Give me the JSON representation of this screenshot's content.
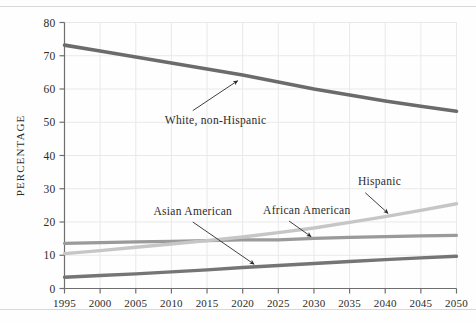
{
  "figure": {
    "background_color": "#fefefe",
    "axis_color": "#6e6e6e",
    "grid_color": "#e9e9ea",
    "text_color": "#2b2b2b"
  },
  "chart_data": {
    "type": "line",
    "title": "",
    "subtitle": "",
    "xlabel": "",
    "ylabel": "PERCENTAGE",
    "x": [
      1995,
      2000,
      2005,
      2010,
      2015,
      2020,
      2025,
      2030,
      2035,
      2040,
      2045,
      2050
    ],
    "xlim": [
      1995,
      2050
    ],
    "ylim": [
      0,
      80
    ],
    "xticks": [
      "1995",
      "2000",
      "2005",
      "2010",
      "2015",
      "2020",
      "2025",
      "2030",
      "2035",
      "2040",
      "2045",
      "2050"
    ],
    "yticks": [
      "0",
      "10",
      "20",
      "30",
      "40",
      "50",
      "60",
      "70",
      "80"
    ],
    "grid": true,
    "legend_position": "inline-annotations",
    "series": [
      {
        "name": "White, non-Hispanic",
        "color": "#6b6b6b",
        "width": 3.6,
        "values": [
          73.2,
          71.4,
          69.6,
          67.8,
          66.0,
          64.2,
          62.1,
          60.0,
          58.2,
          56.4,
          54.8,
          53.3
        ]
      },
      {
        "name": "African American",
        "color": "#9a9a9a",
        "width": 3.2,
        "values": [
          13.6,
          13.8,
          14.0,
          14.2,
          14.4,
          14.6,
          14.6,
          15.1,
          15.4,
          15.6,
          15.8,
          16.0
        ]
      },
      {
        "name": "Hispanic",
        "color": "#c6c6c6",
        "width": 3.4,
        "values": [
          10.5,
          11.4,
          12.4,
          13.4,
          14.4,
          15.5,
          16.8,
          18.2,
          19.9,
          21.6,
          23.5,
          25.5
        ]
      },
      {
        "name": "Asian American",
        "color": "#757575",
        "width": 3.4,
        "values": [
          3.4,
          3.9,
          4.4,
          5.0,
          5.6,
          6.3,
          6.9,
          7.5,
          8.1,
          8.7,
          9.2,
          9.7
        ]
      }
    ],
    "annotations": [
      {
        "text": "White, non-Hispanic",
        "label_x": 2016.2,
        "label_y": 49.5,
        "arrow_from_x": 2013.0,
        "arrow_from_y": 53.5,
        "arrow_to_x": 2019.3,
        "arrow_to_y": 62.5
      },
      {
        "text": "Asian American",
        "label_x": 2013.0,
        "label_y": 22.0,
        "arrow_from_x": 2013.0,
        "arrow_from_y": 20.0,
        "arrow_to_x": 2021.6,
        "arrow_to_y": 7.3
      },
      {
        "text": "African American",
        "label_x": 2029.0,
        "label_y": 22.3,
        "arrow_from_x": 2026.5,
        "arrow_from_y": 20.3,
        "arrow_to_x": 2029.6,
        "arrow_to_y": 15.6
      },
      {
        "text": "Hispanic",
        "label_x": 2039.2,
        "label_y": 31.0,
        "arrow_from_x": 2037.2,
        "arrow_from_y": 28.8,
        "arrow_to_x": 2040.4,
        "arrow_to_y": 22.6
      }
    ]
  }
}
